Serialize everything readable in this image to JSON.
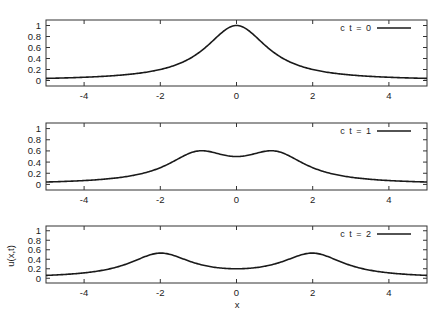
{
  "chart_data": [
    {
      "type": "line",
      "title": "",
      "legend": "c t = 0",
      "legend_position": "top-right",
      "xlabel": "",
      "ylabel": "",
      "xlim": [
        -5,
        5
      ],
      "ylim": [
        -0.1,
        1.1
      ],
      "x_ticks": [
        -4,
        -2,
        0,
        2,
        4
      ],
      "y_ticks": [
        0,
        0.2,
        0.4,
        0.6,
        0.8,
        1
      ],
      "x_tick_labels": [
        "-4",
        "-2",
        "0",
        "2",
        "4"
      ],
      "y_tick_labels": [
        "0",
        "0.2",
        "0.4",
        "0.6",
        "0.8",
        "1"
      ],
      "grid": false,
      "ct": 0,
      "x": [
        -5,
        -4,
        -3,
        -2,
        -1,
        0,
        1,
        2,
        3,
        4,
        5
      ],
      "values": [
        0.04,
        0.06,
        0.1,
        0.2,
        0.5,
        1.0,
        0.5,
        0.2,
        0.1,
        0.06,
        0.04
      ]
    },
    {
      "type": "line",
      "title": "",
      "legend": "c t = 1",
      "legend_position": "top-right",
      "xlabel": "",
      "ylabel": "",
      "xlim": [
        -5,
        5
      ],
      "ylim": [
        -0.1,
        1.1
      ],
      "x_ticks": [
        -4,
        -2,
        0,
        2,
        4
      ],
      "y_ticks": [
        0,
        0.2,
        0.4,
        0.6,
        0.8,
        1
      ],
      "x_tick_labels": [
        "-4",
        "-2",
        "0",
        "2",
        "4"
      ],
      "y_tick_labels": [
        "0",
        "0.2",
        "0.4",
        "0.6",
        "0.8",
        "1"
      ],
      "grid": false,
      "ct": 1,
      "x": [
        -5,
        -4,
        -3,
        -2,
        -1,
        0,
        1,
        2,
        3,
        4,
        5
      ],
      "values": [
        0.05,
        0.08,
        0.15,
        0.3,
        0.6,
        0.5,
        0.6,
        0.3,
        0.15,
        0.08,
        0.05
      ]
    },
    {
      "type": "line",
      "title": "",
      "legend": "c t = 2",
      "legend_position": "top-right",
      "xlabel": "x",
      "ylabel": "u(x,t)",
      "xlim": [
        -5,
        5
      ],
      "ylim": [
        -0.1,
        1.1
      ],
      "x_ticks": [
        -4,
        -2,
        0,
        2,
        4
      ],
      "y_ticks": [
        0,
        0.2,
        0.4,
        0.6,
        0.8,
        1
      ],
      "x_tick_labels": [
        "-4",
        "-2",
        "0",
        "2",
        "4"
      ],
      "y_tick_labels": [
        "0",
        "0.2",
        "0.4",
        "0.6",
        "0.8",
        "1"
      ],
      "grid": false,
      "ct": 2,
      "x": [
        -5,
        -4,
        -3,
        -2,
        -1,
        0,
        1,
        2,
        3,
        4,
        5
      ],
      "values": [
        0.07,
        0.13,
        0.28,
        0.53,
        0.3,
        0.2,
        0.3,
        0.53,
        0.28,
        0.13,
        0.07
      ]
    }
  ],
  "figure": {
    "xlabel": "x",
    "ylabel": "u(x,t)",
    "line_color": "#1a1a1a",
    "frame_color": "#333333"
  }
}
